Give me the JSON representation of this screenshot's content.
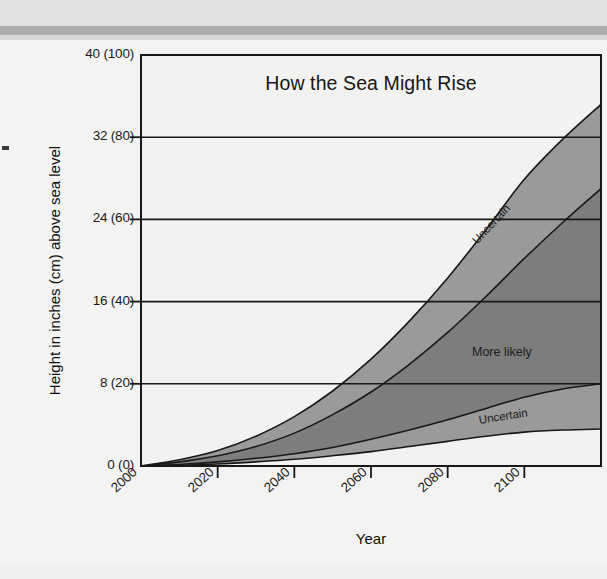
{
  "figure": {
    "title": "How the Sea Might Rise",
    "x_axis_title": "Year",
    "y_axis_title": "Height in inches (cm) above sea level"
  },
  "labels": {
    "uncertain_upper": "Uncertain",
    "more_likely": "More likely",
    "uncertain_lower": "Uncertain"
  },
  "colors": {
    "page_background": "#f3f3f1",
    "plot_background": "#f2f2f0",
    "uncertain_band": "#9a9a9a",
    "more_likely_band": "#7d7d7d",
    "axis_line": "#1a1a1a",
    "grid_line": "#1a1a1a",
    "text": "#161616"
  },
  "chart_data": {
    "type": "area",
    "title": "How the Sea Might Rise",
    "xlabel": "Year",
    "ylabel": "Height in inches (cm) above sea level",
    "xlim": [
      2000,
      2120
    ],
    "ylim": [
      0,
      40
    ],
    "ylim_cm": [
      0,
      100
    ],
    "grid": true,
    "legend": "inline-annotations",
    "x_ticks": [
      2000,
      2020,
      2040,
      2060,
      2080,
      2100
    ],
    "x_tick_labels": [
      "2000",
      "2020",
      "2040",
      "2060",
      "2080",
      "2100"
    ],
    "y_ticks": [
      0,
      8,
      16,
      24,
      32,
      40
    ],
    "y_tick_labels": [
      "0 (0)",
      "8 (20)",
      "16 (40)",
      "24 (60)",
      "32 (80)",
      "40 (100)"
    ],
    "x": [
      2000,
      2010,
      2020,
      2030,
      2040,
      2050,
      2060,
      2070,
      2080,
      2090,
      2100,
      2110,
      2120
    ],
    "series": [
      {
        "name": "Uncertain upper bound",
        "units": "inches above sea level",
        "values": [
          0,
          0.6,
          1.5,
          2.9,
          4.8,
          7.3,
          10.4,
          14.1,
          18.3,
          23.0,
          27.9,
          31.8,
          35.2
        ]
      },
      {
        "name": "More likely upper bound",
        "units": "inches above sea level",
        "values": [
          0,
          0.4,
          1.0,
          1.9,
          3.2,
          5.0,
          7.2,
          9.9,
          13.0,
          16.5,
          20.2,
          23.7,
          27.0
        ]
      },
      {
        "name": "More likely lower bound",
        "units": "inches above sea level",
        "values": [
          0,
          0.15,
          0.4,
          0.75,
          1.2,
          1.8,
          2.6,
          3.5,
          4.5,
          5.6,
          6.7,
          7.5,
          8.0
        ]
      },
      {
        "name": "Uncertain lower bound",
        "units": "inches above sea level",
        "values": [
          0,
          0.08,
          0.2,
          0.4,
          0.65,
          1.0,
          1.4,
          1.9,
          2.4,
          2.9,
          3.3,
          3.5,
          3.6
        ]
      }
    ],
    "bands": [
      {
        "name": "Uncertain",
        "between": [
          "Uncertain upper bound",
          "More likely upper bound"
        ],
        "fill": "#9a9a9a"
      },
      {
        "name": "More likely",
        "between": [
          "More likely upper bound",
          "More likely lower bound"
        ],
        "fill": "#7d7d7d"
      },
      {
        "name": "Uncertain",
        "between": [
          "More likely lower bound",
          "Uncertain lower bound"
        ],
        "fill": "#9a9a9a"
      }
    ]
  }
}
